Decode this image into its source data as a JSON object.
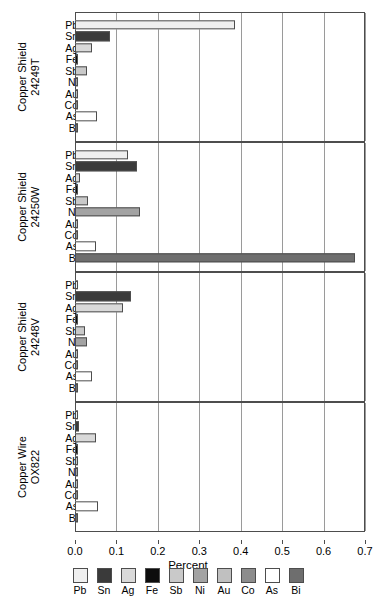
{
  "chart_data": {
    "type": "bar",
    "orientation": "horizontal",
    "title": "",
    "xlabel": "Percent",
    "ylabel": "",
    "xlim": [
      0.0,
      0.7
    ],
    "xticks": [
      "0.0",
      "0.1",
      "0.2",
      "0.3",
      "0.4",
      "0.5",
      "0.6",
      "0.7"
    ],
    "grid": true,
    "legend_position": "bottom",
    "categories": [
      "Pb",
      "Sn",
      "Ag",
      "Fe",
      "Sb",
      "Ni",
      "Au",
      "Co",
      "As",
      "Bi"
    ],
    "colors": {
      "Pb": "#efefef",
      "Sn": "#3a3a3a",
      "Ag": "#d9d9d9",
      "Fe": "#0d0d0d",
      "Sb": "#c9c9c9",
      "Ni": "#a3a3a3",
      "Au": "#c0c0c0",
      "Co": "#8c8c8c",
      "As": "#ffffff",
      "Bi": "#6e6e6e"
    },
    "panels": [
      {
        "name": "Copper Shield\n24249T",
        "values": [
          0.385,
          0.085,
          0.042,
          0.004,
          0.03,
          0.008,
          0.001,
          0.003,
          0.052,
          0.006
        ]
      },
      {
        "name": "Copper Shield\n24250W",
        "values": [
          0.127,
          0.15,
          0.013,
          0.002,
          0.032,
          0.158,
          0.002,
          0.001,
          0.05,
          0.675
        ]
      },
      {
        "name": "Copper Shield\n24248V",
        "values": [
          0.004,
          0.135,
          0.115,
          0.008,
          0.023,
          0.028,
          0.001,
          0.003,
          0.04,
          0.004
        ]
      },
      {
        "name": "Copper Wire\nOX822",
        "values": [
          0.004,
          0.009,
          0.05,
          0.002,
          0.002,
          0.007,
          0.003,
          0.002,
          0.055,
          0.005
        ]
      }
    ]
  }
}
